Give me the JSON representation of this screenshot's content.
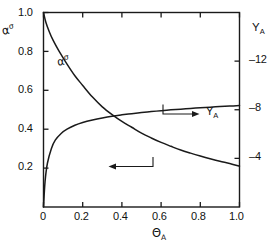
{
  "chart_data": {
    "type": "line",
    "title": "",
    "xlabel": "ΘA",
    "xlabel_base": "Θ",
    "xlabel_sub": "A",
    "ylabel_left": "ασ",
    "ylabel_left_base": "α",
    "ylabel_left_sup": "σ",
    "ylabel_right": "YA",
    "ylabel_right_base": "Y",
    "ylabel_right_sub": "A",
    "xlim": [
      0,
      1.0
    ],
    "ylim_left": [
      0,
      1.0
    ],
    "ylim_right": [
      0,
      16
    ],
    "grid": false,
    "legend": "inline-annotations",
    "xticks": [
      "0",
      "0.2",
      "0.4",
      "0.6",
      "0.8",
      "1.0"
    ],
    "xtick_values": [
      0,
      0.2,
      0.4,
      0.6,
      0.8,
      1.0
    ],
    "yticks_left": [
      "0.2",
      "0.4",
      "0.6",
      "0.8",
      "1.0"
    ],
    "ytick_left_values": [
      0.2,
      0.4,
      0.6,
      0.8,
      1.0
    ],
    "yticks_right": [
      "4",
      "8",
      "12"
    ],
    "ytick_right_values": [
      4,
      8,
      12
    ],
    "series": [
      {
        "name": "ασ",
        "axis": "left",
        "label_text": "α",
        "label_sup": "σ",
        "arrow": "left",
        "x": [
          0.0,
          0.012,
          0.03,
          0.05,
          0.08,
          0.12,
          0.16,
          0.2,
          0.25,
          0.3,
          0.35,
          0.4,
          0.45,
          0.5,
          0.55,
          0.6,
          0.65,
          0.7,
          0.75,
          0.8,
          0.85,
          0.9,
          0.95,
          1.0
        ],
        "y": [
          1.0,
          0.95,
          0.9,
          0.855,
          0.8,
          0.735,
          0.675,
          0.625,
          0.565,
          0.515,
          0.475,
          0.44,
          0.41,
          0.38,
          0.355,
          0.332,
          0.312,
          0.293,
          0.277,
          0.262,
          0.248,
          0.235,
          0.224,
          0.21
        ]
      },
      {
        "name": "YA",
        "axis": "right",
        "label_text": "Y",
        "label_sub": "A",
        "arrow": "right",
        "x": [
          0.0,
          0.008,
          0.02,
          0.04,
          0.06,
          0.09,
          0.12,
          0.16,
          0.2,
          0.25,
          0.3,
          0.35,
          0.4,
          0.45,
          0.5,
          0.55,
          0.6,
          0.65,
          0.7,
          0.75,
          0.8,
          0.85,
          0.9,
          0.95,
          1.0
        ],
        "y": [
          0.0,
          2.1,
          3.6,
          4.8,
          5.5,
          6.05,
          6.4,
          6.72,
          6.95,
          7.16,
          7.33,
          7.47,
          7.58,
          7.68,
          7.77,
          7.85,
          7.92,
          7.99,
          8.05,
          8.11,
          8.16,
          8.21,
          8.26,
          8.3,
          8.34
        ]
      }
    ]
  },
  "annotations": {
    "left_arrow_label": "ασ",
    "right_arrow_label": "YA"
  }
}
